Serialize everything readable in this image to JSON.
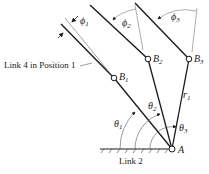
{
  "diagram": {
    "type": "four-bar linkage positions",
    "labels": {
      "link4_position1": "Link 4 in Position 1",
      "link2": "Link 2",
      "pivot_A": "A",
      "r1": "r",
      "r1_sub": "1"
    },
    "points": [
      {
        "name": "B",
        "sub": "1"
      },
      {
        "name": "B",
        "sub": "2"
      },
      {
        "name": "B",
        "sub": "3"
      }
    ],
    "angles": [
      {
        "name": "θ",
        "sub": "1"
      },
      {
        "name": "θ",
        "sub": "2"
      },
      {
        "name": "θ",
        "sub": "3"
      }
    ],
    "phis": [
      {
        "name": "ϕ",
        "sub": "1"
      },
      {
        "name": "ϕ",
        "sub": "2"
      },
      {
        "name": "ϕ",
        "sub": "3"
      }
    ],
    "colors": {
      "line": "#1a1a1a",
      "thin": "#555555",
      "background": "#ffffff"
    }
  }
}
